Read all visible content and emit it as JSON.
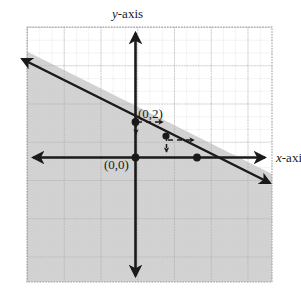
{
  "figure": {
    "type": "coordinate-plane-inequality-graph",
    "background_color": "#ffffff",
    "labels": {
      "y_axis": "y-axis",
      "x_axis": "x-axis",
      "y_intercept_point": "(0,2)",
      "origin_point": "(0,0)"
    }
  },
  "chart_data": {
    "type": "line",
    "title": "",
    "xlabel": "x-axis",
    "ylabel": "y-axis",
    "grid": true,
    "legend": "none",
    "xlim": [
      -6.2,
      7.8
    ],
    "ylim": [
      -7.2,
      7.4
    ],
    "boundary_line": {
      "style": "solid",
      "color": "#1a1a1a",
      "slope": -0.5,
      "y_intercept": 2,
      "equation": "y = -0.5x + 2",
      "points": [
        {
          "label": "(0,2)",
          "x": 0,
          "y": 2,
          "marked": true
        },
        {
          "label": "(4,0)",
          "x": 4,
          "y": 0,
          "marked": true
        },
        {
          "label": "(2,1)",
          "x": 2,
          "y": 1,
          "marked": true
        }
      ],
      "arrow_ends": [
        "left",
        "right"
      ]
    },
    "shaded_region": {
      "side": "below",
      "color": "#d2d2d2",
      "description": "region below and left of the boundary line is shaded"
    },
    "slope_triangle": {
      "style": "dashed-with-arrowheads",
      "run": 2,
      "rise": -1,
      "segments": [
        {
          "from": [
            0,
            2
          ],
          "to": [
            2,
            2
          ],
          "direction": "right"
        },
        {
          "from": [
            2,
            2
          ],
          "to": [
            2,
            1
          ],
          "direction": "down"
        },
        {
          "from": [
            2,
            1
          ],
          "to": [
            4,
            1
          ],
          "direction": "right"
        },
        {
          "from": [
            4,
            1
          ],
          "to": [
            4,
            0
          ],
          "direction": "down"
        }
      ]
    },
    "axes": {
      "x_axis": {
        "style": "double-arrow",
        "color": "#1a1a1a"
      },
      "y_axis": {
        "style": "double-arrow",
        "color": "#1a1a1a"
      }
    },
    "gridlines": {
      "minor_spacing_units": 0.7,
      "major_every": 3,
      "minor_color": "#c9c9c9",
      "major_color": "#9a9a9a"
    }
  }
}
